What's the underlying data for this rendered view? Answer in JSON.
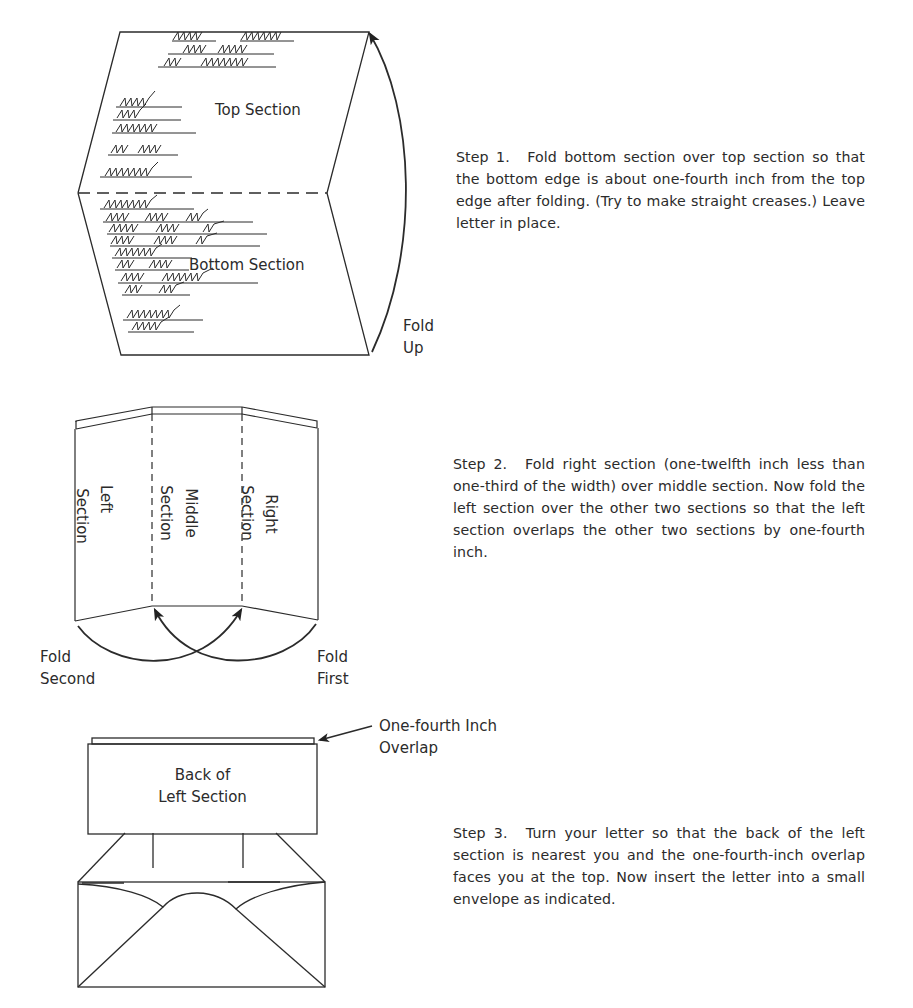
{
  "step1": {
    "diagram": {
      "top_label": "Top Section",
      "bottom_label": "Bottom Section",
      "fold_label_line1": "Fold",
      "fold_label_line2": "Up"
    },
    "label": "Step 1.",
    "text": "Fold bottom section over top section so that the bottom edge is about one-fourth inch from the top edge after folding. (Try to make straight creases.) Leave letter in place."
  },
  "step2": {
    "diagram": {
      "left_label_line1": "Left",
      "left_label_line2": "Section",
      "middle_label_line1": "Middle",
      "middle_label_line2": "Section",
      "right_label_line1": "Right",
      "right_label_line2": "Section",
      "fold_second_line1": "Fold",
      "fold_second_line2": "Second",
      "fold_first_line1": "Fold",
      "fold_first_line2": "First"
    },
    "label": "Step 2.",
    "text": "Fold right section (one-twelfth inch less than one-third of the width) over middle section. Now fold the left section over the other two sections so that the left section overlaps the other two sections by one-fourth inch."
  },
  "step3": {
    "diagram": {
      "back_label_line1": "Back of",
      "back_label_line2": "Left Section",
      "overlap_label_line1": "One-fourth Inch",
      "overlap_label_line2": "Overlap"
    },
    "label": "Step 3.",
    "text": "Turn your letter so that the back of the left section is nearest you and the one-fourth-inch overlap faces you at the top. Now insert the letter into a small envelope as indicated."
  },
  "colors": {
    "ink": "#2b2b2b",
    "paper": "#ffffff"
  }
}
